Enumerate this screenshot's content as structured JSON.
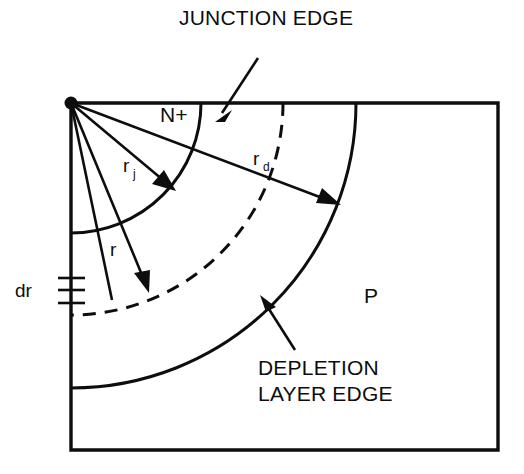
{
  "figure": {
    "kind": "cross-section-diagram",
    "background_color": "#ffffff",
    "ink_color": "#0d0d0d"
  },
  "labels": {
    "title": "JUNCTION EDGE",
    "depletion_line1": "DEPLETION",
    "depletion_line2": "LAYER EDGE",
    "region_n": "N+",
    "region_p": "P",
    "radius_junction_base": "r",
    "radius_junction_sub": "j",
    "radius_depletion_base": "r",
    "radius_depletion_sub": "d",
    "radius_generic": "r",
    "differential": "dr"
  },
  "geometry": {
    "origin": {
      "x": 71,
      "y": 103
    },
    "frame": {
      "left": 71,
      "top": 103,
      "right": 498,
      "bottom": 450
    },
    "arcs": [
      {
        "name": "junction-edge",
        "radius": 130,
        "style": "solid"
      },
      {
        "name": "radius-r-arc",
        "radius": 212,
        "style": "dashed"
      },
      {
        "name": "depletion-layer-edge",
        "radius": 285,
        "style": "solid"
      }
    ],
    "dr_ticks": {
      "x": 71,
      "y_values": [
        278,
        290,
        303
      ],
      "half_width": 14
    }
  }
}
